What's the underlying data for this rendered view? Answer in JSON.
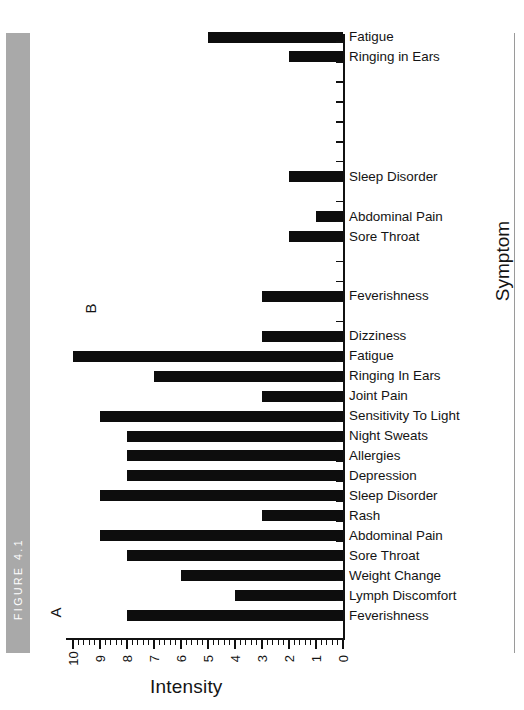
{
  "figure": {
    "strip_label": "FIGURE 4.1",
    "strip_color": "#a9a9a9"
  },
  "chart_data": {
    "type": "bar",
    "orientation": "horizontal",
    "title": "",
    "xlabel": "Intensity",
    "ylabel": "Symptom",
    "xlim": [
      10,
      0
    ],
    "x_tick_labels": [
      "10",
      "9",
      "8",
      "7",
      "6",
      "5",
      "4",
      "3",
      "2",
      "1",
      "0"
    ],
    "x_tick_values": [
      10,
      9,
      8,
      7,
      6,
      5,
      4,
      3,
      2,
      1,
      0
    ],
    "x_axis_direction": "right-to-left",
    "minor_ticks_per_interval": 4,
    "grid": false,
    "legend": null,
    "bar_color": "#0d0d0d",
    "panels": [
      {
        "letter": "B",
        "categories": [
          "Fatigue",
          "Ringing in Ears",
          "",
          "",
          "",
          "",
          "",
          "Sleep Disorder",
          "",
          "Abdominal Pain",
          "Sore Throat",
          "",
          "",
          "Feverishness",
          ""
        ],
        "values": [
          5,
          2,
          0,
          0,
          0,
          0,
          0,
          2,
          0,
          1,
          2,
          0,
          0,
          3,
          0
        ]
      },
      {
        "letter": "A",
        "categories": [
          "Dizziness",
          "Fatigue",
          "Ringing In Ears",
          "Joint Pain",
          "Sensitivity To Light",
          "Night Sweats",
          "Allergies",
          "Depression",
          "Sleep Disorder",
          "Rash",
          "Abdominal Pain",
          "Sore Throat",
          "Weight Change",
          "Lymph Discomfort",
          "Feverishness"
        ],
        "values": [
          3,
          10,
          7,
          3,
          9,
          8,
          8,
          8,
          9,
          3,
          9,
          8,
          6,
          4,
          8
        ]
      }
    ]
  }
}
